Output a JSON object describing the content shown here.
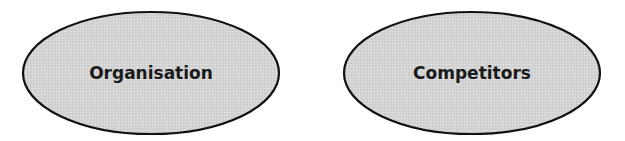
{
  "diagram": {
    "nodes": [
      {
        "id": "organisation",
        "label": "Organisation",
        "shape": "ellipse",
        "cx": 151,
        "cy": 73,
        "rx": 128,
        "ry": 61
      },
      {
        "id": "competitors",
        "label": "Competitors",
        "shape": "ellipse",
        "cx": 472,
        "cy": 73,
        "rx": 128,
        "ry": 61
      }
    ],
    "colors": {
      "fill": "#d4d4d4",
      "stroke": "#111111",
      "text": "#1a1a1a",
      "background": "#ffffff"
    }
  }
}
